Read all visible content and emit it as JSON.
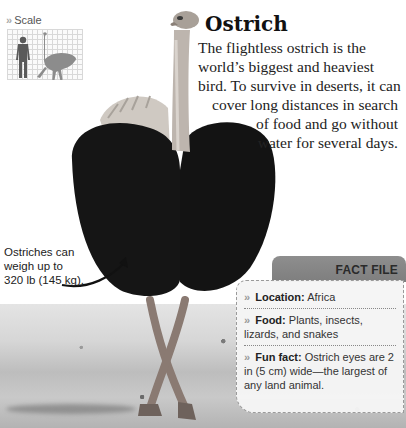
{
  "scale": {
    "label": "Scale",
    "chevron": "»",
    "icon": "human-vs-ostrich-scale-icon"
  },
  "header": {
    "title": "Ostrich"
  },
  "intro": {
    "lines": [
      "The flightless ostrich is the",
      "world’s biggest and heaviest",
      "bird. To survive in deserts, it can",
      "cover long distances in search",
      "of food and go without",
      "water for several days."
    ]
  },
  "annotation": {
    "lines": [
      "Ostriches can",
      "weigh up to",
      "320 lb (145 kg)."
    ]
  },
  "fact_file": {
    "title": "FACT FILE",
    "chevron": "»",
    "items": [
      {
        "key": "Location:",
        "value": " Africa"
      },
      {
        "key": "Food:",
        "value": " Plants, insects, lizards, and snakes"
      },
      {
        "key": "Fun fact:",
        "value": " Ostrich eyes are 2 in (5 cm) wide—the largest of any land animal."
      }
    ]
  },
  "colors": {
    "tab": "#858585",
    "box_border": "#9a9a9a",
    "text": "#222222"
  }
}
